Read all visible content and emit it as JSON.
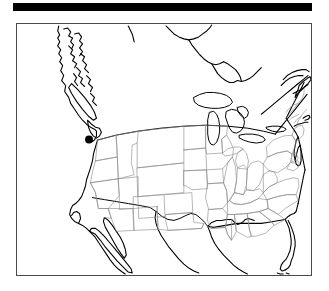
{
  "figure": {
    "type": "locator-map",
    "region": "United States",
    "background_color": "#ffffff",
    "header_bar": {
      "label": "",
      "color": "#000000"
    },
    "frame": {
      "border_color": "#4a4a4a",
      "fill_color": "#ffffff"
    },
    "styles": {
      "coastline_color": "#000000",
      "national_border_color": "#000000",
      "state_border_color": "#8a8a8a",
      "marker_color": "#000000"
    },
    "markers": [
      {
        "name": "location-marker",
        "state": "Utah",
        "x": 88.5,
        "y": 139.5,
        "radius": 4.0,
        "color": "#000000"
      }
    ],
    "legend": {
      "visible": false,
      "entries": []
    },
    "labels": {
      "title": "",
      "caption": "",
      "tick_labels": []
    }
  }
}
